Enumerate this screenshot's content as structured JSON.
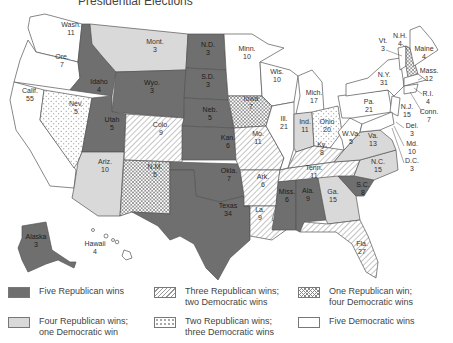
{
  "title": "Presidential Elections",
  "colors": {
    "five_rep": "#6f6f6f",
    "four_rep": "#d9d9d9",
    "three_rep": "hatch-diagonal",
    "two_rep": "dots",
    "one_rep": "crosshatch",
    "five_dem": "#ffffff"
  },
  "legend": [
    {
      "key": "five_rep",
      "line1": "Five Republican wins",
      "line2": ""
    },
    {
      "key": "three_rep",
      "line1": "Three Republican wins;",
      "line2": "two Democratic wins"
    },
    {
      "key": "one_rep",
      "line1": "One Republican win;",
      "line2": "four Democratic wins"
    },
    {
      "key": "four_rep",
      "line1": "Four Republican wins;",
      "line2": "one Democratic win"
    },
    {
      "key": "two_rep",
      "line1": "Two Republican wins;",
      "line2": "three Democratic wins"
    },
    {
      "key": "five_dem",
      "line1": "Five Democratic wins",
      "line2": ""
    }
  ],
  "states": [
    {
      "abbr": "Wash.",
      "votes": "11",
      "category": "five_dem"
    },
    {
      "abbr": "Ore.",
      "votes": "7",
      "category": "five_dem"
    },
    {
      "abbr": "Calif.",
      "votes": "55",
      "category": "five_dem"
    },
    {
      "abbr": "Idaho",
      "votes": "4",
      "category": "five_rep"
    },
    {
      "abbr": "Nev.",
      "votes": "5",
      "category": "two_rep"
    },
    {
      "abbr": "Mont.",
      "votes": "3",
      "category": "four_rep"
    },
    {
      "abbr": "Wyo.",
      "votes": "3",
      "category": "five_rep"
    },
    {
      "abbr": "Utah",
      "votes": "5",
      "category": "five_rep"
    },
    {
      "abbr": "Colo.",
      "votes": "9",
      "category": "three_rep"
    },
    {
      "abbr": "Ariz.",
      "votes": "10",
      "category": "four_rep"
    },
    {
      "abbr": "N.M.",
      "votes": "5",
      "category": "one_rep"
    },
    {
      "abbr": "N.D.",
      "votes": "3",
      "category": "five_rep"
    },
    {
      "abbr": "S.D.",
      "votes": "3",
      "category": "five_rep"
    },
    {
      "abbr": "Neb.",
      "votes": "5",
      "category": "five_rep"
    },
    {
      "abbr": "Kan.",
      "votes": "6",
      "category": "five_rep"
    },
    {
      "abbr": "Okla.",
      "votes": "7",
      "category": "five_rep"
    },
    {
      "abbr": "Texas",
      "votes": "34",
      "category": "five_rep"
    },
    {
      "abbr": "Minn.",
      "votes": "10",
      "category": "five_dem"
    },
    {
      "abbr": "Iowa",
      "votes": "7",
      "category": "one_rep"
    },
    {
      "abbr": "Mo.",
      "votes": "11",
      "category": "three_rep"
    },
    {
      "abbr": "Ark.",
      "votes": "6",
      "category": "three_rep"
    },
    {
      "abbr": "La.",
      "votes": "9",
      "category": "three_rep"
    },
    {
      "abbr": "Wis.",
      "votes": "10",
      "category": "five_dem"
    },
    {
      "abbr": "Ill.",
      "votes": "21",
      "category": "five_dem"
    },
    {
      "abbr": "Mich.",
      "votes": "17",
      "category": "five_dem"
    },
    {
      "abbr": "Ind.",
      "votes": "11",
      "category": "four_rep"
    },
    {
      "abbr": "Ohio",
      "votes": "20",
      "category": "two_rep"
    },
    {
      "abbr": "Ky.",
      "votes": "8",
      "category": "three_rep"
    },
    {
      "abbr": "Tenn.",
      "votes": "11",
      "category": "three_rep"
    },
    {
      "abbr": "Miss.",
      "votes": "6",
      "category": "five_rep"
    },
    {
      "abbr": "Ala.",
      "votes": "9",
      "category": "five_rep"
    },
    {
      "abbr": "Ga.",
      "votes": "15",
      "category": "four_rep"
    },
    {
      "abbr": "Fla.",
      "votes": "27",
      "category": "three_rep"
    },
    {
      "abbr": "S.C.",
      "votes": "8",
      "category": "five_rep"
    },
    {
      "abbr": "N.C.",
      "votes": "15",
      "category": "four_rep"
    },
    {
      "abbr": "Va.",
      "votes": "13",
      "category": "four_rep"
    },
    {
      "abbr": "W.Va.",
      "votes": "5",
      "category": "five_dem"
    },
    {
      "abbr": "Pa.",
      "votes": "21",
      "category": "five_dem"
    },
    {
      "abbr": "N.Y.",
      "votes": "31",
      "category": "five_dem"
    },
    {
      "abbr": "Vt.",
      "votes": "3",
      "category": "five_dem"
    },
    {
      "abbr": "N.H.",
      "votes": "4",
      "category": "one_rep"
    },
    {
      "abbr": "Maine",
      "votes": "4",
      "category": "five_dem"
    },
    {
      "abbr": "Mass.",
      "votes": "12",
      "category": "five_dem"
    },
    {
      "abbr": "R.I.",
      "votes": "4",
      "category": "five_dem"
    },
    {
      "abbr": "Conn.",
      "votes": "7",
      "category": "five_dem"
    },
    {
      "abbr": "N.J.",
      "votes": "15",
      "category": "five_dem"
    },
    {
      "abbr": "Del.",
      "votes": "3",
      "category": "five_dem"
    },
    {
      "abbr": "Md.",
      "votes": "10",
      "category": "five_dem"
    },
    {
      "abbr": "D.C.",
      "votes": "3",
      "category": "five_dem"
    },
    {
      "abbr": "Alaska",
      "votes": "3",
      "category": "five_rep"
    },
    {
      "abbr": "Hawaii",
      "votes": "4",
      "category": "five_dem"
    }
  ]
}
